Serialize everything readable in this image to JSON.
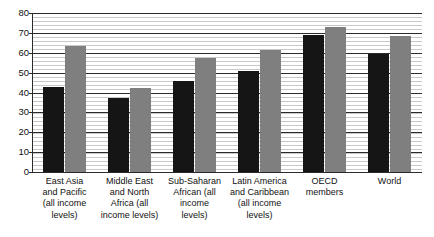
{
  "chart_data": {
    "type": "bar",
    "title": "",
    "subtitle": "",
    "xlabel": "",
    "ylabel": "",
    "ylim": [
      0,
      80
    ],
    "yticks": [
      0,
      10,
      20,
      30,
      40,
      50,
      60,
      70,
      80
    ],
    "ytick_labels": [
      "0",
      "10",
      "20",
      "30",
      "40",
      "50",
      "60",
      "70",
      "80"
    ],
    "grid": true,
    "grid_minor": true,
    "legend": false,
    "legend_position": "none",
    "categories": [
      "East Asia\nand Pacific\n(all income\nlevels)",
      "Middle East\nand North\nAfrica (all\nincome levels)",
      "Sub-Saharan\nAfrican (all\nincome\nlevels)",
      "Latin America\nand Caribbean\n(all income\nlevels)",
      "OECD\nmembers",
      "World"
    ],
    "series": [
      {
        "name": "series-dark",
        "color": "#151515",
        "values": [
          43,
          37,
          46,
          51,
          69,
          59.5
        ]
      },
      {
        "name": "series-gray",
        "color": "#7f7f7f",
        "values": [
          63.5,
          42.5,
          57.5,
          61.5,
          73,
          68.5
        ]
      }
    ]
  },
  "colors": {
    "dark_bar": "#151515",
    "gray_bar": "#7f7f7f",
    "axis": "#2b2b2b",
    "minor_gridline": "#c9c9c9",
    "background": "#ffffff"
  }
}
